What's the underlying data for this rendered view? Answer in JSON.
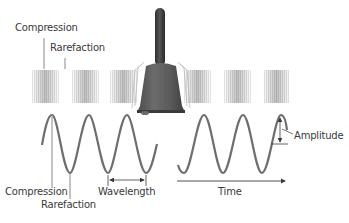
{
  "diagram": {
    "type": "sound-wave-illustration",
    "source_object": "hand bell",
    "labels": {
      "top_compression": "Compression",
      "top_rarefaction": "Rarefaction",
      "bottom_compression": "Compression",
      "bottom_rarefaction": "Rarefaction",
      "wavelength": "Wavelength",
      "time": "Time",
      "amplitude": "Amplitude"
    },
    "colors": {
      "wave": "#6e6e6e",
      "text": "#3a3a3a",
      "bell_body": "#5a5a5a",
      "bell_handle": "#3c3c3c",
      "compression_band": "#9a9a9a"
    },
    "compression_bands": {
      "left": [
        32,
        72,
        110
      ],
      "right": [
        182,
        222,
        262
      ]
    }
  }
}
